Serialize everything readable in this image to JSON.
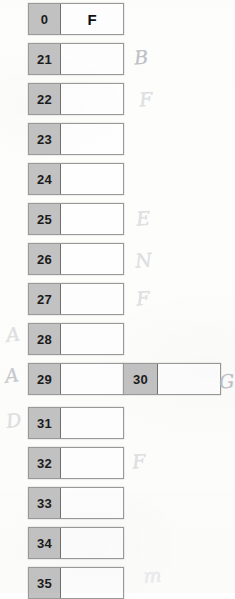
{
  "document": {
    "type": "scanned-worksheet",
    "description": "Column of two-cell blocks with handwritten pencil margin notes",
    "colors": {
      "key_cell_fill": "#c2c2c2",
      "value_cell_fill": "#fefefe",
      "block_border": "#9a9a9a",
      "divider": "#6f6f6f",
      "page_background": "#fdfdfc",
      "pencil_ink": "#b9bcc2"
    }
  },
  "rows": [
    {
      "key": "0",
      "value": "F",
      "top": 3,
      "left": 28,
      "annotation_left": "",
      "annotation_right": ""
    },
    {
      "key": "21",
      "value": "",
      "top": 43,
      "left": 28,
      "annotation_left": "",
      "annotation_right": "B"
    },
    {
      "key": "22",
      "value": "",
      "top": 83,
      "left": 28,
      "annotation_left": "",
      "annotation_right": "F"
    },
    {
      "key": "23",
      "value": "",
      "top": 123,
      "left": 28,
      "annotation_left": "",
      "annotation_right": ""
    },
    {
      "key": "24",
      "value": "",
      "top": 163,
      "left": 28,
      "annotation_left": "",
      "annotation_right": ""
    },
    {
      "key": "25",
      "value": "",
      "top": 203,
      "left": 28,
      "annotation_left": "",
      "annotation_right": "E"
    },
    {
      "key": "26",
      "value": "",
      "top": 243,
      "left": 28,
      "annotation_left": "",
      "annotation_right": "N"
    },
    {
      "key": "27",
      "value": "",
      "top": 283,
      "left": 28,
      "annotation_left": "",
      "annotation_right": "F"
    },
    {
      "key": "28",
      "value": "",
      "top": 323,
      "left": 28,
      "annotation_left": "A",
      "annotation_right": ""
    },
    {
      "key": "29",
      "value": "",
      "top": 363,
      "left": 28,
      "annotation_left": "A",
      "annotation_right": ""
    },
    {
      "key": "31",
      "value": "",
      "top": 407,
      "left": 28,
      "annotation_left": "D",
      "annotation_right": ""
    },
    {
      "key": "32",
      "value": "",
      "top": 447,
      "left": 28,
      "annotation_left": "",
      "annotation_right": "F"
    },
    {
      "key": "33",
      "value": "",
      "top": 487,
      "left": 28,
      "annotation_left": "",
      "annotation_right": ""
    },
    {
      "key": "34",
      "value": "",
      "top": 527,
      "left": 28,
      "annotation_left": "",
      "annotation_right": ""
    },
    {
      "key": "35",
      "value": "",
      "top": 567,
      "left": 28,
      "annotation_left": "",
      "annotation_right": ""
    }
  ],
  "secondary_blocks": [
    {
      "key": "30",
      "value": "",
      "top": 363,
      "left": 123,
      "annotation_right": "G"
    }
  ],
  "trailing_annotations": [
    {
      "text": "m",
      "top": 566,
      "left": 143
    }
  ]
}
